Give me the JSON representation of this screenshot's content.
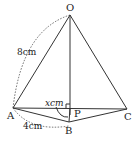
{
  "diagram": {
    "points": {
      "O": {
        "label": "O",
        "x": 70,
        "y": 15
      },
      "A": {
        "label": "A",
        "x": 13,
        "y": 108
      },
      "B": {
        "label": "B",
        "x": 69,
        "y": 122
      },
      "C": {
        "label": "C",
        "x": 127,
        "y": 109
      },
      "P": {
        "label": "P",
        "x": 70,
        "y": 108
      }
    },
    "measurements": {
      "OA": "8cm",
      "AB": "4cm",
      "BP": "xcm"
    }
  }
}
